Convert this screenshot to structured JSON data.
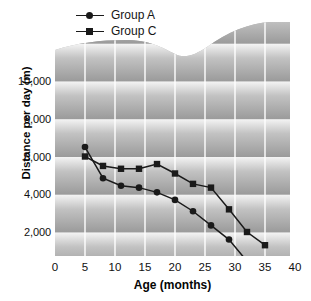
{
  "chart_data": {
    "type": "line",
    "title": "",
    "xlabel": "Age (months)",
    "ylabel": "Distance per day (m)",
    "xlim": [
      0,
      41
    ],
    "ylim": [
      0,
      11500
    ],
    "xticks": [
      0,
      5,
      10,
      15,
      20,
      25,
      30,
      35,
      40
    ],
    "xtick_labels": [
      "0",
      "5",
      "10",
      "15",
      "20",
      "25",
      "30",
      "35",
      "40"
    ],
    "yticks": [
      2000,
      4000,
      6000,
      8000,
      10000
    ],
    "ytick_labels": [
      "2,000",
      "4,000",
      "6,000",
      "8,000",
      "10,000"
    ],
    "grid": true,
    "grid_color": "#ffffff",
    "legend_position": "top-left",
    "series": [
      {
        "name": "Group A",
        "marker": "circle",
        "color": "#1a1a1a",
        "x": [
          5,
          8,
          11,
          14,
          17,
          20,
          23,
          26,
          29,
          32,
          35
        ],
        "values": [
          6500,
          4850,
          4450,
          4350,
          4100,
          3700,
          3100,
          2350,
          1600,
          450,
          420
        ]
      },
      {
        "name": "Group C",
        "marker": "square",
        "color": "#1a1a1a",
        "x": [
          5,
          8,
          11,
          14,
          17,
          20,
          23,
          26,
          29,
          32,
          35
        ],
        "values": [
          6000,
          5500,
          5350,
          5350,
          5600,
          5100,
          4550,
          4350,
          3200,
          2000,
          1300
        ]
      }
    ]
  },
  "legend": {
    "items": [
      {
        "label": "Group A",
        "marker": "circle-marker-icon"
      },
      {
        "label": "Group C",
        "marker": "square-marker-icon"
      }
    ]
  },
  "axes": {
    "x_title": "Age (months)",
    "y_title": "Distance per day (m)"
  }
}
